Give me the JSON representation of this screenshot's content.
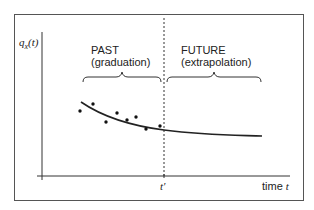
{
  "diagram": {
    "y_axis_label": "q_x(t)",
    "y_axis_label_main": "q",
    "y_axis_label_sub": "x",
    "y_axis_label_arg": "(t)",
    "x_axis_label_text": "time",
    "x_axis_label_var": "t",
    "divider_label": "t′",
    "regions": [
      {
        "title": "PAST",
        "subtitle": "(graduation)"
      },
      {
        "title": "FUTURE",
        "subtitle": "(extrapolation)"
      }
    ],
    "colors": {
      "line": "#222222",
      "frame": "#555555",
      "background": "#ffffff"
    },
    "data_points": [
      [
        80,
        111
      ],
      [
        93,
        104
      ],
      [
        106,
        122
      ],
      [
        117,
        113
      ],
      [
        127,
        120
      ],
      [
        136,
        117
      ],
      [
        146,
        129
      ],
      [
        160,
        126
      ]
    ],
    "fitted_curve": "M81,102 C100,115 125,125 164,130 S230,135 262,136"
  }
}
